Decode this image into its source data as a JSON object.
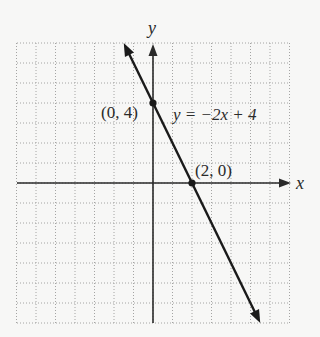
{
  "chart_data": {
    "type": "line",
    "title": "",
    "xlabel": "x",
    "ylabel": "y",
    "xlim": [
      -7,
      7
    ],
    "ylim": [
      -7,
      7
    ],
    "grid": true,
    "grid_style": "dotted",
    "series": [
      {
        "name": "y = -2x + 4",
        "equation": "y = -2x + 4",
        "slope": -2,
        "intercept": 4,
        "x": [
          -1.5,
          5.5
        ],
        "y": [
          7,
          -7
        ],
        "arrows": "both"
      }
    ],
    "points": [
      {
        "x": 0,
        "y": 4,
        "label": "(0, 4)"
      },
      {
        "x": 2,
        "y": 0,
        "label": "(2, 0)"
      }
    ],
    "annotations": [
      {
        "text": "y = −2x + 4"
      }
    ]
  },
  "labels": {
    "x_axis": "x",
    "y_axis": "y",
    "point_y_intercept": "(0, 4)",
    "point_x_intercept": "(2, 0)",
    "equation": "y = −2x + 4"
  },
  "colors": {
    "background": "#f7f7f6",
    "grid": "#9a9a9a",
    "axis": "#2a2a2a",
    "line": "#1a1a1a"
  }
}
